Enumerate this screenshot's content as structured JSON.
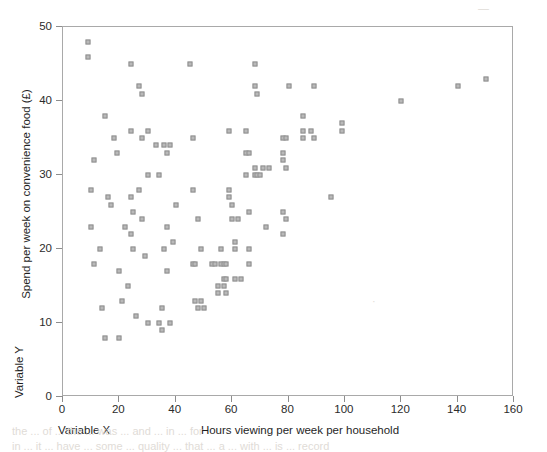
{
  "figure": {
    "background_color": "#ffffff",
    "frame_color": "#a9a9a9",
    "marker_fill": "#b9b9b9",
    "marker_edge": "#8f8f8f",
    "text_color": "#2b2b2b"
  },
  "axis_titles": {
    "y_primary": "Spend per week on convenience food (£)",
    "y_secondary": "Variable Y",
    "x_primary": "Hours viewing per week per household",
    "x_secondary": "Variable X"
  },
  "chart_data": {
    "type": "scatter",
    "title": "",
    "xlabel": "Hours viewing per week per household",
    "ylabel": "Spend per week on convenience food (£)",
    "xlim": [
      0,
      160
    ],
    "ylim": [
      0,
      50
    ],
    "xticks": [
      0,
      20,
      40,
      60,
      80,
      100,
      120,
      140,
      160
    ],
    "yticks": [
      0,
      10,
      20,
      30,
      40,
      50
    ],
    "xtick_labels": [
      "0",
      "20",
      "40",
      "60",
      "80",
      "100",
      "120",
      "140",
      "160"
    ],
    "ytick_labels": [
      "0",
      "10",
      "20",
      "30",
      "40",
      "50"
    ],
    "grid": false,
    "legend": null,
    "marker": "square",
    "series": [
      {
        "name": "Households",
        "points": [
          [
            9,
            48
          ],
          [
            9,
            46
          ],
          [
            10,
            28
          ],
          [
            10,
            23
          ],
          [
            11,
            32
          ],
          [
            11,
            18
          ],
          [
            13,
            20
          ],
          [
            14,
            12
          ],
          [
            15,
            38
          ],
          [
            15,
            8
          ],
          [
            16,
            27
          ],
          [
            17,
            26
          ],
          [
            18,
            35
          ],
          [
            19,
            33
          ],
          [
            20,
            8
          ],
          [
            20,
            17
          ],
          [
            21,
            13
          ],
          [
            22,
            23
          ],
          [
            23,
            15
          ],
          [
            24,
            45
          ],
          [
            24,
            36
          ],
          [
            24,
            27
          ],
          [
            24,
            22
          ],
          [
            25,
            25
          ],
          [
            25,
            20
          ],
          [
            26,
            11
          ],
          [
            27,
            42
          ],
          [
            27,
            28
          ],
          [
            28,
            41
          ],
          [
            28,
            35
          ],
          [
            28,
            24
          ],
          [
            29,
            19
          ],
          [
            30,
            36
          ],
          [
            30,
            30
          ],
          [
            30,
            10
          ],
          [
            33,
            34
          ],
          [
            34,
            30
          ],
          [
            34,
            10
          ],
          [
            35,
            9
          ],
          [
            35,
            12
          ],
          [
            36,
            34
          ],
          [
            36,
            20
          ],
          [
            37,
            33
          ],
          [
            37,
            23
          ],
          [
            37,
            17
          ],
          [
            38,
            34
          ],
          [
            38,
            10
          ],
          [
            39,
            21
          ],
          [
            40,
            26
          ],
          [
            45,
            45
          ],
          [
            46,
            35
          ],
          [
            46,
            28
          ],
          [
            46,
            18
          ],
          [
            47,
            18
          ],
          [
            47,
            13
          ],
          [
            48,
            24
          ],
          [
            48,
            12
          ],
          [
            49,
            20
          ],
          [
            49,
            13
          ],
          [
            50,
            12
          ],
          [
            53,
            18
          ],
          [
            54,
            18
          ],
          [
            55,
            15
          ],
          [
            55,
            14
          ],
          [
            56,
            18
          ],
          [
            56,
            20
          ],
          [
            57,
            18
          ],
          [
            57,
            15
          ],
          [
            57,
            16
          ],
          [
            58,
            18
          ],
          [
            58,
            14
          ],
          [
            58,
            16
          ],
          [
            59,
            28
          ],
          [
            59,
            27
          ],
          [
            59,
            36
          ],
          [
            60,
            26
          ],
          [
            60,
            24
          ],
          [
            61,
            21
          ],
          [
            61,
            16
          ],
          [
            61,
            20
          ],
          [
            62,
            24
          ],
          [
            63,
            16
          ],
          [
            65,
            36
          ],
          [
            65,
            33
          ],
          [
            65,
            30
          ],
          [
            66,
            25
          ],
          [
            66,
            33
          ],
          [
            66,
            20
          ],
          [
            66,
            18
          ],
          [
            68,
            45
          ],
          [
            68,
            42
          ],
          [
            68,
            31
          ],
          [
            68,
            30
          ],
          [
            69,
            41
          ],
          [
            69,
            30
          ],
          [
            70,
            30
          ],
          [
            71,
            31
          ],
          [
            72,
            23
          ],
          [
            73,
            31
          ],
          [
            78,
            35
          ],
          [
            78,
            33
          ],
          [
            78,
            32
          ],
          [
            78,
            25
          ],
          [
            78,
            22
          ],
          [
            79,
            35
          ],
          [
            79,
            31
          ],
          [
            79,
            24
          ],
          [
            80,
            42
          ],
          [
            85,
            38
          ],
          [
            85,
            36
          ],
          [
            85,
            35
          ],
          [
            88,
            36
          ],
          [
            89,
            42
          ],
          [
            89,
            35
          ],
          [
            95,
            27
          ],
          [
            99,
            37
          ],
          [
            99,
            36
          ],
          [
            120,
            40
          ],
          [
            140,
            42
          ],
          [
            150,
            43
          ]
        ]
      }
    ]
  },
  "artifacts": [
    {
      "text": "—",
      "x": 478,
      "y": 2
    },
    {
      "text": "·",
      "x": 372,
      "y": 295
    },
    {
      "text": "the  ...  of  ...  the  ...  was  ...  and  ...  in  ...  for",
      "x": 12,
      "y": 425
    },
    {
      "text": "in  ...  it  ...  have  ...  some  ...  quality  ...  that  ...  a  ...  with  ...  is  ...  record",
      "x": 12,
      "y": 440
    }
  ]
}
